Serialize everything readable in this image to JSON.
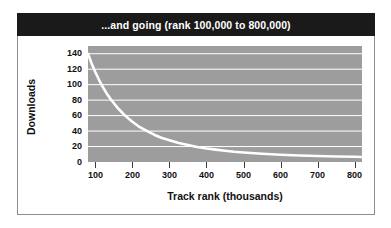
{
  "figure": {
    "title": "...and going (rank 100,000 to 800,000)",
    "frame_color": "#8d8d92",
    "banner_color": "#1a1a1a",
    "banner_text_color": "#ffffff",
    "page_background": "#ffffff"
  },
  "chart_data": {
    "type": "line",
    "title": "...and going (rank 100,000 to 800,000)",
    "subtitle": "",
    "xlabel": "Track rank (thousands)",
    "ylabel": "Downloads",
    "xlim": [
      80,
      820
    ],
    "ylim": [
      0,
      150
    ],
    "xticks": [
      100,
      200,
      300,
      400,
      500,
      600,
      700,
      800
    ],
    "xtick_labels": [
      "100",
      "200",
      "300",
      "400",
      "500",
      "600",
      "700",
      "800"
    ],
    "yticks": [
      0,
      20,
      40,
      60,
      80,
      100,
      120,
      140
    ],
    "ytick_labels": [
      "0",
      "20",
      "40",
      "60",
      "80",
      "100",
      "120",
      "140"
    ],
    "grid": "horizontal",
    "grid_color": "#ffffff",
    "plot_background": "#9d9d9d",
    "line_color": "#ffffff",
    "line_width": 2.6,
    "legend": "none",
    "series": [
      {
        "name": "Downloads",
        "x": [
          80,
          90,
          100,
          110,
          120,
          130,
          140,
          150,
          160,
          170,
          180,
          190,
          200,
          220,
          240,
          260,
          280,
          300,
          325,
          350,
          375,
          400,
          425,
          450,
          475,
          500,
          550,
          600,
          650,
          700,
          750,
          800,
          820
        ],
        "values": [
          140,
          127,
          116,
          106,
          97,
          89,
          82,
          76,
          70,
          65,
          60,
          56,
          52,
          45,
          40,
          35,
          31,
          28,
          24.5,
          22,
          19.5,
          17.5,
          16,
          14.5,
          13.2,
          12.2,
          10.6,
          9.4,
          8.5,
          7.8,
          7.2,
          6.7,
          6.5
        ]
      }
    ]
  }
}
